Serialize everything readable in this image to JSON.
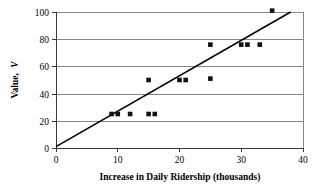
{
  "chart_data": {
    "type": "scatter",
    "title": "",
    "xlabel": "Increase in Daily Ridership (thousands)",
    "ylabel": "Value, V",
    "ylabel_text": "Value,",
    "ylabel_symbol": "V",
    "xlim": [
      0,
      40
    ],
    "ylim": [
      0,
      100
    ],
    "xticks": [
      0,
      10,
      20,
      30,
      40
    ],
    "yticks": [
      0,
      20,
      40,
      60,
      80,
      100
    ],
    "xtick_labels": [
      "0",
      "10",
      "20",
      "30",
      "40"
    ],
    "ytick_labels": [
      "0",
      "20",
      "40",
      "60",
      "80",
      "100"
    ],
    "grid": "horizontal",
    "legend": "none",
    "marker": "square",
    "marker_color": "#111111",
    "points": [
      {
        "x": 9,
        "y": 25
      },
      {
        "x": 10,
        "y": 25
      },
      {
        "x": 12,
        "y": 25
      },
      {
        "x": 15,
        "y": 25
      },
      {
        "x": 16,
        "y": 25
      },
      {
        "x": 15,
        "y": 50
      },
      {
        "x": 20,
        "y": 50
      },
      {
        "x": 21,
        "y": 50
      },
      {
        "x": 25,
        "y": 51
      },
      {
        "x": 25,
        "y": 76
      },
      {
        "x": 30,
        "y": 76
      },
      {
        "x": 31,
        "y": 76
      },
      {
        "x": 33,
        "y": 76
      },
      {
        "x": 35,
        "y": 101
      }
    ],
    "series": [
      {
        "name": "Observations",
        "x": [
          9,
          10,
          12,
          15,
          16,
          15,
          20,
          21,
          25,
          25,
          30,
          31,
          33,
          35
        ],
        "values": [
          25,
          25,
          25,
          25,
          25,
          50,
          50,
          50,
          51,
          76,
          76,
          76,
          76,
          101
        ]
      }
    ],
    "trendline": {
      "type": "line",
      "x": [
        0,
        38
      ],
      "y": [
        1,
        100
      ],
      "color": "#000000"
    }
  }
}
